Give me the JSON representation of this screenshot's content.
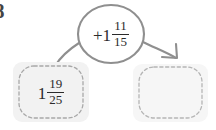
{
  "problem": {
    "number": "8"
  },
  "operator_bubble": {
    "name": "add-one-and-eleven-fifteenths",
    "sign": "+",
    "whole": "1",
    "numerator": "11",
    "denominator": "15",
    "full_text": "+1 11/15",
    "stroke_color": "#8f8f8f",
    "fill_color": "#ffffff"
  },
  "input_box": {
    "name": "starting-value",
    "whole": "1",
    "numerator": "19",
    "denominator": "25",
    "full_text": "1 19/25",
    "fill_color": "#f2f2f2",
    "border_color": "#a8a8a8",
    "border_style": "dashed"
  },
  "output_box": {
    "name": "answer-blank",
    "whole": "",
    "numerator": "",
    "denominator": "",
    "full_text": "",
    "fill_color": "#f6f6f6",
    "border_color": "#b5b5b5",
    "border_style": "dashed"
  },
  "connectors": {
    "left_line": {
      "name": "input-to-bubble-line",
      "arrowhead": "none",
      "color": "#8f8f8f"
    },
    "right_arrow": {
      "name": "bubble-to-answer-arrow",
      "arrowhead": "open-v",
      "color": "#8f8f8f"
    }
  }
}
